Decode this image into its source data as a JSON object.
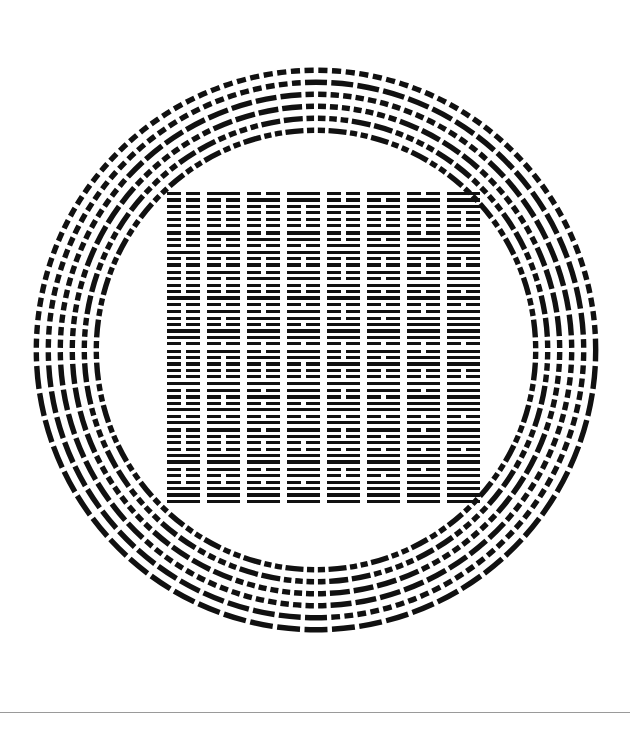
{
  "page": {
    "width": 630,
    "height": 737,
    "background_color": "#ffffff",
    "ink_color": "#111111"
  },
  "figure": {
    "name": "fuxi-64-hexagram-arrangement",
    "hexagram_count_square": 64,
    "hexagram_count_circle": 64,
    "line_types": {
      "yang": "solid",
      "yin": "broken"
    },
    "bit_order": "top-line-is-least-significant",
    "sequence": "binary 0 to 63, left to right, top to bottom"
  },
  "square": {
    "name": "inner-square-grid",
    "left": 163,
    "top": 190,
    "right": 483,
    "bottom": 505,
    "cols": 8,
    "rows": 8,
    "cell_width": 40,
    "cell_height": 39.4,
    "hexagram_width": 33,
    "line_thickness": 3.2,
    "line_gap": 3.2,
    "yin_gap": 5,
    "values": [
      0,
      1,
      2,
      3,
      4,
      5,
      6,
      7,
      8,
      9,
      10,
      11,
      12,
      13,
      14,
      15,
      16,
      17,
      18,
      19,
      20,
      21,
      22,
      23,
      24,
      25,
      26,
      27,
      28,
      29,
      30,
      31,
      32,
      33,
      34,
      35,
      36,
      37,
      38,
      39,
      40,
      41,
      42,
      43,
      44,
      45,
      46,
      47,
      48,
      49,
      50,
      51,
      52,
      53,
      54,
      55,
      56,
      57,
      58,
      59,
      60,
      61,
      62,
      63
    ]
  },
  "circle": {
    "name": "outer-hexagram-ring",
    "center_x": 316,
    "center_y": 350,
    "outer_radius": 289,
    "inner_radius": 217,
    "count": 64,
    "line_thickness": 5.4,
    "radial_line_pitch": 12.0,
    "angular_half_width_deg": 2.35,
    "yin_gap_deg": 0.95,
    "start_angle_deg": 180,
    "direction": "clockwise",
    "values": [
      0,
      1,
      2,
      3,
      4,
      5,
      6,
      7,
      8,
      9,
      10,
      11,
      12,
      13,
      14,
      15,
      16,
      17,
      18,
      19,
      20,
      21,
      22,
      23,
      24,
      25,
      26,
      27,
      28,
      29,
      30,
      31,
      32,
      33,
      34,
      35,
      36,
      37,
      38,
      39,
      40,
      41,
      42,
      43,
      44,
      45,
      46,
      47,
      48,
      49,
      50,
      51,
      52,
      53,
      54,
      55,
      56,
      57,
      58,
      59,
      60,
      61,
      62,
      63
    ]
  },
  "rule": {
    "name": "bottom-divider",
    "y": 712,
    "color": "#9a9a9a",
    "thickness": 1
  }
}
